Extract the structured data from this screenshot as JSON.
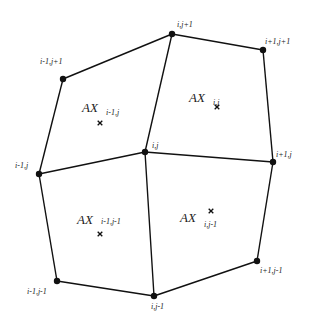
{
  "diagram": {
    "type": "structured-grid-cells",
    "colors": {
      "stroke": "#111111",
      "text": "#222222",
      "background": "#ffffff"
    },
    "nodes": [
      {
        "id": "im1_jp1",
        "label": "i-1,j+1",
        "x": 63,
        "y": 79,
        "lx": 40,
        "ly": 64
      },
      {
        "id": "i_jp1",
        "label": "i,j+1",
        "x": 172,
        "y": 34,
        "lx": 177,
        "ly": 27
      },
      {
        "id": "ip1_jp1",
        "label": "i+1,j+1",
        "x": 263,
        "y": 50,
        "lx": 265,
        "ly": 44
      },
      {
        "id": "im1_j",
        "label": "i-1,j",
        "x": 39,
        "y": 174,
        "lx": 15,
        "ly": 168
      },
      {
        "id": "i_j",
        "label": "i,j",
        "x": 145,
        "y": 152,
        "lx": 152,
        "ly": 148
      },
      {
        "id": "ip1_j",
        "label": "i+1,j",
        "x": 273,
        "y": 162,
        "lx": 276,
        "ly": 157
      },
      {
        "id": "im1_jm1",
        "label": "i-1,j-1",
        "x": 57,
        "y": 281,
        "lx": 27,
        "ly": 294
      },
      {
        "id": "i_jm1",
        "label": "i,j-1",
        "x": 154,
        "y": 296,
        "lx": 151,
        "ly": 309
      },
      {
        "id": "ip1_jm1",
        "label": "i+1,j-1",
        "x": 257,
        "y": 261,
        "lx": 260,
        "ly": 273
      }
    ],
    "edges": [
      [
        "im1_jp1",
        "i_jp1"
      ],
      [
        "i_jp1",
        "ip1_jp1"
      ],
      [
        "im1_j",
        "i_j"
      ],
      [
        "i_j",
        "ip1_j"
      ],
      [
        "im1_jm1",
        "i_jm1"
      ],
      [
        "i_jm1",
        "ip1_jm1"
      ],
      [
        "im1_jp1",
        "im1_j"
      ],
      [
        "im1_j",
        "im1_jm1"
      ],
      [
        "i_jp1",
        "i_j"
      ],
      [
        "i_j",
        "i_jm1"
      ],
      [
        "ip1_jp1",
        "ip1_j"
      ],
      [
        "ip1_j",
        "ip1_jm1"
      ]
    ],
    "cells": [
      {
        "id": "cell_im1_j",
        "main": "AX",
        "sub": "i-1,j",
        "tx": 82,
        "ty": 112,
        "sx": 106,
        "sy": 115,
        "mx": 100,
        "my": 123
      },
      {
        "id": "cell_i_j",
        "main": "AX",
        "sub": "i,j",
        "tx": 189,
        "ty": 102,
        "sx": 213,
        "sy": 105,
        "mx": 217,
        "my": 107
      },
      {
        "id": "cell_im1_jm1",
        "main": "AX",
        "sub": "i-1,j-1",
        "tx": 77,
        "ty": 224,
        "sx": 101,
        "sy": 224,
        "mx": 100,
        "my": 234
      },
      {
        "id": "cell_i_jm1",
        "main": "AX",
        "sub": "i,j-1",
        "tx": 180,
        "ty": 222,
        "sx": 204,
        "sy": 227,
        "mx": 211,
        "my": 211
      }
    ]
  }
}
